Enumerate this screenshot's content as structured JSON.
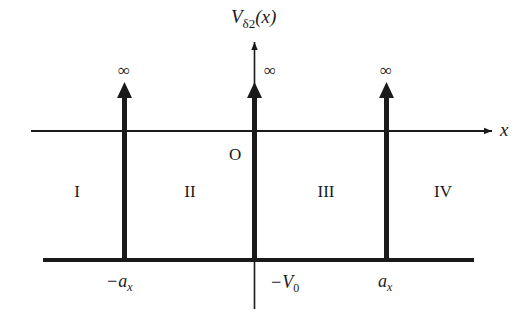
{
  "diagram": {
    "title_axis_label": {
      "main": "V",
      "sub": "δ2",
      "arg": "(x)"
    },
    "x_axis_label": "x",
    "origin_label": "O",
    "infinity_symbol": "∞",
    "regions": [
      {
        "id": "I",
        "label": "I"
      },
      {
        "id": "II",
        "label": "II"
      },
      {
        "id": "III",
        "label": "III"
      },
      {
        "id": "IV",
        "label": "IV"
      }
    ],
    "delta_spikes": [
      {
        "position_label": "−a",
        "position_sub": "x",
        "height_label": "∞"
      },
      {
        "position_label": "0",
        "position_sub": "",
        "height_label": "∞"
      },
      {
        "position_label": "a",
        "position_sub": "x",
        "height_label": "∞"
      }
    ],
    "potential_floor_label": {
      "main": "−V",
      "sub": "0"
    },
    "colors": {
      "ink": "#1a1a1a",
      "background": "#ffffff"
    }
  }
}
